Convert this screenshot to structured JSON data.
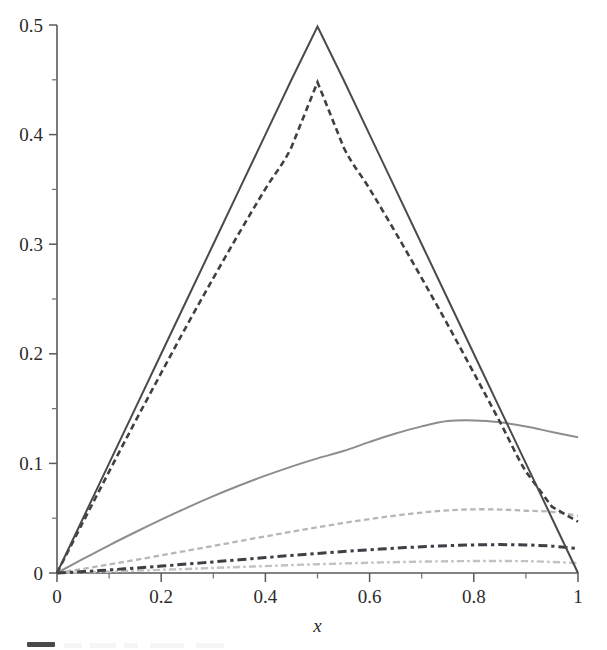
{
  "chart_data": {
    "type": "line",
    "title": "",
    "xlabel": "x",
    "ylabel": "",
    "xlim": [
      0,
      1
    ],
    "ylim": [
      0,
      0.5
    ],
    "grid": false,
    "legend_position": "below-plot-clipped",
    "x_ticks": [
      0,
      0.2,
      0.4,
      0.6,
      0.8,
      1
    ],
    "x_tick_labels": [
      "0",
      "0.2",
      "0.4",
      "0.6",
      "0.8",
      "1"
    ],
    "x_minor_ticks": [
      0.1,
      0.3,
      0.5,
      0.7,
      0.9
    ],
    "y_ticks": [
      0,
      0.1,
      0.2,
      0.3,
      0.4,
      0.5
    ],
    "y_tick_labels": [
      "0",
      "0.1",
      "0.2",
      "0.3",
      "0.4",
      "0.5"
    ],
    "y_minor_ticks": [
      0.05,
      0.15,
      0.25,
      0.35,
      0.45
    ],
    "series": [
      {
        "name": "series-1-triangle-solid-dark",
        "style": "solid",
        "color": "#4a4a4a",
        "width": 2.0,
        "x": [
          0,
          0.05,
          0.1,
          0.15,
          0.2,
          0.25,
          0.3,
          0.35,
          0.4,
          0.45,
          0.5,
          0.55,
          0.6,
          0.65,
          0.7,
          0.75,
          0.8,
          0.85,
          0.9,
          0.95,
          1
        ],
        "values": [
          0,
          0.05,
          0.1,
          0.15,
          0.2,
          0.25,
          0.3,
          0.35,
          0.4,
          0.45,
          0.4985,
          0.45,
          0.4,
          0.35,
          0.3,
          0.25,
          0.2,
          0.15,
          0.1,
          0.05,
          0
        ]
      },
      {
        "name": "series-2-dashed-dark",
        "style": "dashed",
        "color": "#3f3f46",
        "width": 2.6,
        "x": [
          0,
          0.05,
          0.1,
          0.15,
          0.2,
          0.25,
          0.3,
          0.35,
          0.4,
          0.45,
          0.5,
          0.55,
          0.6,
          0.65,
          0.7,
          0.75,
          0.8,
          0.85,
          0.9,
          0.95,
          1
        ],
        "values": [
          0,
          0.0465,
          0.0925,
          0.138,
          0.1825,
          0.2265,
          0.269,
          0.3105,
          0.3505,
          0.3885,
          0.4478,
          0.3885,
          0.3505,
          0.3105,
          0.269,
          0.2265,
          0.1825,
          0.138,
          0.0925,
          0.0605,
          0.0468
        ]
      },
      {
        "name": "series-3-solid-gray",
        "style": "solid",
        "color": "#8d8d8d",
        "width": 2.0,
        "x": [
          0,
          0.05,
          0.1,
          0.15,
          0.2,
          0.25,
          0.3,
          0.35,
          0.4,
          0.45,
          0.5,
          0.55,
          0.6,
          0.65,
          0.7,
          0.75,
          0.8,
          0.85,
          0.9,
          0.95,
          1
        ],
        "values": [
          0,
          0.0128,
          0.0253,
          0.0372,
          0.0487,
          0.0597,
          0.0701,
          0.0798,
          0.0888,
          0.0971,
          0.1046,
          0.1113,
          0.1196,
          0.1273,
          0.1338,
          0.1386,
          0.1392,
          0.1375,
          0.1337,
          0.1287,
          0.1238
        ]
      },
      {
        "name": "series-4-dashed-light-gray",
        "style": "dashed",
        "color": "#b6b6b6",
        "width": 2.3,
        "x": [
          0,
          0.05,
          0.1,
          0.15,
          0.2,
          0.25,
          0.3,
          0.35,
          0.4,
          0.45,
          0.5,
          0.55,
          0.6,
          0.65,
          0.7,
          0.75,
          0.8,
          0.85,
          0.9,
          0.95,
          1
        ],
        "values": [
          0,
          0.0038,
          0.0078,
          0.0119,
          0.0161,
          0.0204,
          0.0247,
          0.0291,
          0.0334,
          0.0376,
          0.0417,
          0.0456,
          0.0492,
          0.0524,
          0.0551,
          0.0571,
          0.0581,
          0.0579,
          0.0568,
          0.0558,
          0.0522
        ]
      },
      {
        "name": "series-5-dash-dot-dark",
        "style": "dash-dot",
        "color": "#3f3f46",
        "width": 3.0,
        "x": [
          0,
          0.05,
          0.1,
          0.15,
          0.2,
          0.25,
          0.3,
          0.35,
          0.4,
          0.45,
          0.5,
          0.55,
          0.6,
          0.65,
          0.7,
          0.75,
          0.8,
          0.85,
          0.9,
          0.95,
          1
        ],
        "values": [
          0,
          0.0013,
          0.0028,
          0.0045,
          0.0063,
          0.0082,
          0.0101,
          0.0121,
          0.0141,
          0.016,
          0.0178,
          0.0196,
          0.0212,
          0.0227,
          0.0239,
          0.0249,
          0.0256,
          0.0259,
          0.0256,
          0.0245,
          0.0222
        ]
      },
      {
        "name": "series-6-dash-dot-light-gray",
        "style": "dash-dot",
        "color": "#c2c2c2",
        "width": 2.4,
        "x": [
          0,
          0.05,
          0.1,
          0.15,
          0.2,
          0.25,
          0.3,
          0.35,
          0.4,
          0.45,
          0.5,
          0.55,
          0.6,
          0.65,
          0.7,
          0.75,
          0.8,
          0.85,
          0.9,
          0.95,
          1
        ],
        "values": [
          0,
          0.0006,
          0.0013,
          0.0021,
          0.0029,
          0.0037,
          0.0046,
          0.0055,
          0.0063,
          0.0072,
          0.008,
          0.0087,
          0.0094,
          0.0099,
          0.0104,
          0.0107,
          0.0109,
          0.0109,
          0.0108,
          0.0101,
          0.0091
        ]
      }
    ]
  },
  "axes": {
    "x_title": "x"
  },
  "legend": {
    "clipped_note": ""
  }
}
